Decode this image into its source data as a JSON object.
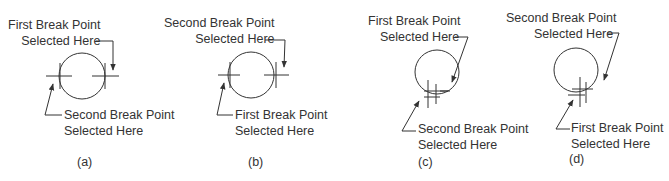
{
  "figures": [
    {
      "id": "a",
      "caption": "(a)",
      "top_label": [
        "First Break Point",
        "Selected Here"
      ],
      "bottom_label": [
        "Second Break Point",
        "Selected Here"
      ]
    },
    {
      "id": "b",
      "caption": "(b)",
      "top_label": [
        "Second Break Point",
        "Selected Here"
      ],
      "bottom_label": [
        "First Break Point",
        "Selected Here"
      ]
    },
    {
      "id": "c",
      "caption": "(c)",
      "top_label": [
        "First Break Point",
        "Selected Here"
      ],
      "bottom_label": [
        "Second Break Point",
        "Selected Here"
      ]
    },
    {
      "id": "d",
      "caption": "(d)",
      "top_label": [
        "Second Break Point",
        "Selected Here"
      ],
      "bottom_label": [
        "First Break Point",
        "Selected Here"
      ]
    }
  ],
  "colors": {
    "stroke": "#333333",
    "background": "#ffffff"
  }
}
